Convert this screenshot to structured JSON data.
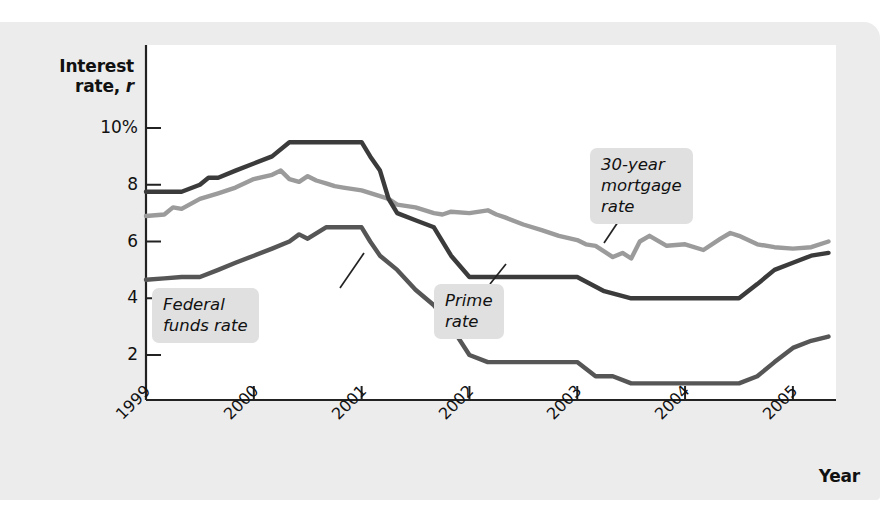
{
  "figure": {
    "background_color": "#ececec",
    "plot_background_color": "#ffffff"
  },
  "axes": {
    "y_title_line1": "Interest",
    "y_title_line2": "rate, ",
    "y_title_symbol": "r",
    "x_title": "Year",
    "y_ticks": [
      "10%",
      "8",
      "6",
      "4",
      "2"
    ],
    "x_ticks": [
      "1999",
      "2000",
      "2001",
      "2002",
      "2003",
      "2004",
      "2005"
    ]
  },
  "callouts": {
    "mortgage": "30-year\nmortgage\nrate",
    "fedfunds": "Federal\nfunds rate",
    "prime": "Prime\nrate"
  },
  "chart_data": {
    "type": "line",
    "title": "",
    "xlabel": "Year",
    "ylabel": "Interest rate, r",
    "xlim": [
      1999,
      2005.4
    ],
    "ylim": [
      0,
      11
    ],
    "grid": false,
    "legend": "annotated-callouts",
    "y_tick_values": [
      10,
      8,
      6,
      4,
      2
    ],
    "y_tick_labels": [
      "10%",
      "8",
      "6",
      "4",
      "2"
    ],
    "x_tick_values": [
      1999,
      2000,
      2001,
      2002,
      2003,
      2004,
      2005
    ],
    "series": [
      {
        "name": "Prime rate",
        "color": "#3b3b3b",
        "x": [
          1999.0,
          1999.17,
          1999.33,
          1999.5,
          1999.58,
          1999.67,
          1999.83,
          2000.0,
          2000.17,
          2000.33,
          2000.5,
          2000.67,
          2000.83,
          2001.0,
          2001.08,
          2001.17,
          2001.25,
          2001.33,
          2001.5,
          2001.67,
          2001.83,
          2002.0,
          2002.08,
          2002.17,
          2002.33,
          2002.5,
          2002.75,
          2003.0,
          2003.25,
          2003.5,
          2003.58,
          2003.75,
          2004.0,
          2004.25,
          2004.5,
          2004.67,
          2004.83,
          2005.0,
          2005.17,
          2005.33
        ],
        "y": [
          7.75,
          7.75,
          7.75,
          8.0,
          8.25,
          8.25,
          8.5,
          8.75,
          9.0,
          9.5,
          9.5,
          9.5,
          9.5,
          9.5,
          9.0,
          8.5,
          7.5,
          7.0,
          6.75,
          6.5,
          5.5,
          4.75,
          4.75,
          4.75,
          4.75,
          4.75,
          4.75,
          4.75,
          4.25,
          4.0,
          4.0,
          4.0,
          4.0,
          4.0,
          4.0,
          4.5,
          5.0,
          5.25,
          5.5,
          5.6
        ]
      },
      {
        "name": "30-year mortgage rate",
        "color": "#9b9b9b",
        "x": [
          1999.0,
          1999.17,
          1999.25,
          1999.33,
          1999.5,
          1999.67,
          1999.83,
          2000.0,
          2000.17,
          2000.25,
          2000.33,
          2000.42,
          2000.5,
          2000.58,
          2000.67,
          2000.75,
          2000.83,
          2001.0,
          2001.17,
          2001.25,
          2001.33,
          2001.5,
          2001.67,
          2001.75,
          2001.83,
          2002.0,
          2002.17,
          2002.25,
          2002.33,
          2002.5,
          2002.67,
          2002.83,
          2003.0,
          2003.08,
          2003.17,
          2003.33,
          2003.42,
          2003.5,
          2003.58,
          2003.67,
          2003.83,
          2004.0,
          2004.17,
          2004.33,
          2004.42,
          2004.5,
          2004.67,
          2004.83,
          2005.0,
          2005.17,
          2005.33
        ],
        "y": [
          6.9,
          6.95,
          7.2,
          7.15,
          7.5,
          7.7,
          7.9,
          8.2,
          8.35,
          8.5,
          8.2,
          8.1,
          8.3,
          8.15,
          8.05,
          7.95,
          7.9,
          7.8,
          7.6,
          7.5,
          7.3,
          7.2,
          7.0,
          6.95,
          7.05,
          7.0,
          7.1,
          6.95,
          6.85,
          6.6,
          6.4,
          6.2,
          6.05,
          5.9,
          5.85,
          5.45,
          5.6,
          5.4,
          6.0,
          6.2,
          5.85,
          5.9,
          5.7,
          6.1,
          6.3,
          6.2,
          5.9,
          5.8,
          5.75,
          5.8,
          6.0
        ]
      },
      {
        "name": "Federal funds rate",
        "color": "#565656",
        "x": [
          1999.0,
          1999.17,
          1999.33,
          1999.5,
          1999.67,
          1999.83,
          2000.0,
          2000.17,
          2000.33,
          2000.42,
          2000.5,
          2000.67,
          2000.83,
          2001.0,
          2001.08,
          2001.17,
          2001.33,
          2001.5,
          2001.67,
          2001.83,
          2002.0,
          2002.17,
          2002.33,
          2002.5,
          2002.75,
          2003.0,
          2003.17,
          2003.33,
          2003.5,
          2003.67,
          2004.0,
          2004.33,
          2004.5,
          2004.67,
          2004.83,
          2005.0,
          2005.17,
          2005.33
        ],
        "y": [
          4.65,
          4.7,
          4.75,
          4.75,
          5.0,
          5.25,
          5.5,
          5.75,
          6.0,
          6.25,
          6.1,
          6.5,
          6.5,
          6.5,
          6.0,
          5.5,
          5.0,
          4.3,
          3.75,
          3.0,
          2.0,
          1.75,
          1.75,
          1.75,
          1.75,
          1.75,
          1.25,
          1.25,
          1.0,
          1.0,
          1.0,
          1.0,
          1.0,
          1.25,
          1.75,
          2.25,
          2.5,
          2.65
        ]
      }
    ]
  },
  "geometry": {
    "plot_left": 146,
    "plot_right": 836,
    "plot_top": 45,
    "plot_bottom": 400,
    "y_pixel_10": 128,
    "y_pixel_2": 355
  }
}
